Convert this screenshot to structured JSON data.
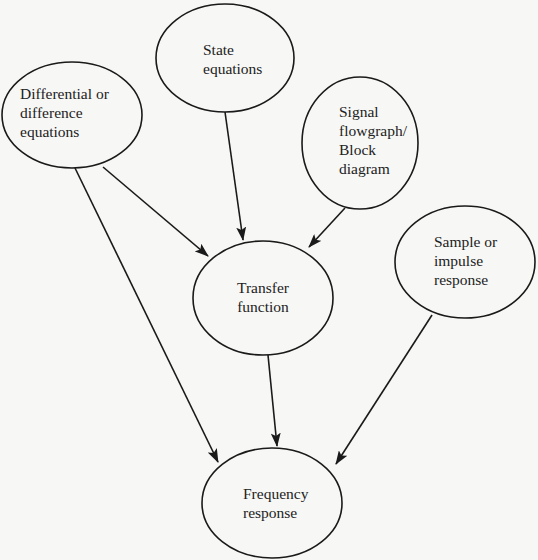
{
  "diagram": {
    "type": "flow",
    "background": "#f7f7f5",
    "stroke_color": "#1a1a1a",
    "nodes": [
      {
        "id": "differential",
        "lines": [
          "Differential or",
          "difference",
          "equations"
        ],
        "cx": 72,
        "cy": 115,
        "rx": 70,
        "ry": 53,
        "align": "left",
        "tx": 20,
        "ty": 84
      },
      {
        "id": "state",
        "lines": [
          "State",
          "equations"
        ],
        "cx": 225,
        "cy": 58,
        "rx": 69,
        "ry": 54,
        "align": "left",
        "tx": 203,
        "ty": 40
      },
      {
        "id": "signal",
        "lines": [
          "Signal",
          "flowgraph/",
          "Block",
          "diagram"
        ],
        "cx": 360,
        "cy": 143,
        "rx": 58,
        "ry": 66,
        "align": "left",
        "tx": 339,
        "ty": 102
      },
      {
        "id": "transfer",
        "lines": [
          "Transfer",
          "function"
        ],
        "cx": 263,
        "cy": 298,
        "rx": 70,
        "ry": 57,
        "align": "center",
        "tx": 213,
        "ty": 278
      },
      {
        "id": "sample",
        "lines": [
          "Sample or",
          "impulse",
          "response"
        ],
        "cx": 465,
        "cy": 262,
        "rx": 70,
        "ry": 56,
        "align": "left",
        "tx": 434,
        "ty": 232
      },
      {
        "id": "frequency",
        "lines": [
          "Frequency",
          "response"
        ],
        "cx": 272,
        "cy": 503,
        "rx": 70,
        "ry": 55,
        "align": "left",
        "tx": 243,
        "ty": 484
      }
    ],
    "edges": [
      {
        "from": "differential",
        "to": "transfer",
        "x1": 103,
        "y1": 167,
        "x2": 208,
        "y2": 256
      },
      {
        "from": "differential",
        "to": "frequency",
        "x1": 75,
        "y1": 168,
        "x2": 218,
        "y2": 462
      },
      {
        "from": "state",
        "to": "transfer",
        "x1": 225,
        "y1": 112,
        "x2": 243,
        "y2": 240
      },
      {
        "from": "signal",
        "to": "transfer",
        "x1": 345,
        "y1": 208,
        "x2": 309,
        "y2": 247
      },
      {
        "from": "transfer",
        "to": "frequency",
        "x1": 268,
        "y1": 355,
        "x2": 277,
        "y2": 446
      },
      {
        "from": "sample",
        "to": "frequency",
        "x1": 432,
        "y1": 315,
        "x2": 336,
        "y2": 464
      }
    ]
  }
}
